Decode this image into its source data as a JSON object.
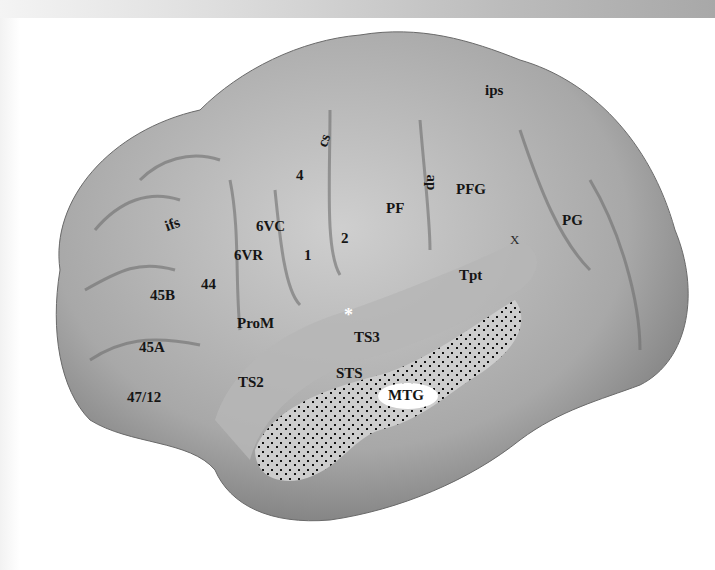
{
  "figure": {
    "type": "lateral view of cortical surface (inflated brain rendering)",
    "colors": {
      "background": "#ffffff",
      "surface_light": "#d2d2d2",
      "surface_mid": "#a9a9a9",
      "surface_dark": "#6e6e6e",
      "label_text": "#151515",
      "stipple": "#111111",
      "asterisk": "#ffffff"
    }
  },
  "labels": {
    "ips": "ips",
    "cs": "cs",
    "ap": "ap",
    "ifs": "ifs",
    "area_4": "4",
    "area_6vc": "6VC",
    "area_6vr": "6VR",
    "area_1": "1",
    "area_2": "2",
    "pf": "PF",
    "pfg": "PFG",
    "pg": "PG",
    "x": "X",
    "area_44": "44",
    "area_45b": "45B",
    "area_45a": "45A",
    "area_47_12": "47/12",
    "prom": "ProM",
    "tpt": "Tpt",
    "ts3": "TS3",
    "ts2": "TS2",
    "sts": "STS",
    "mtg": "MTG",
    "asterisk": "*"
  }
}
